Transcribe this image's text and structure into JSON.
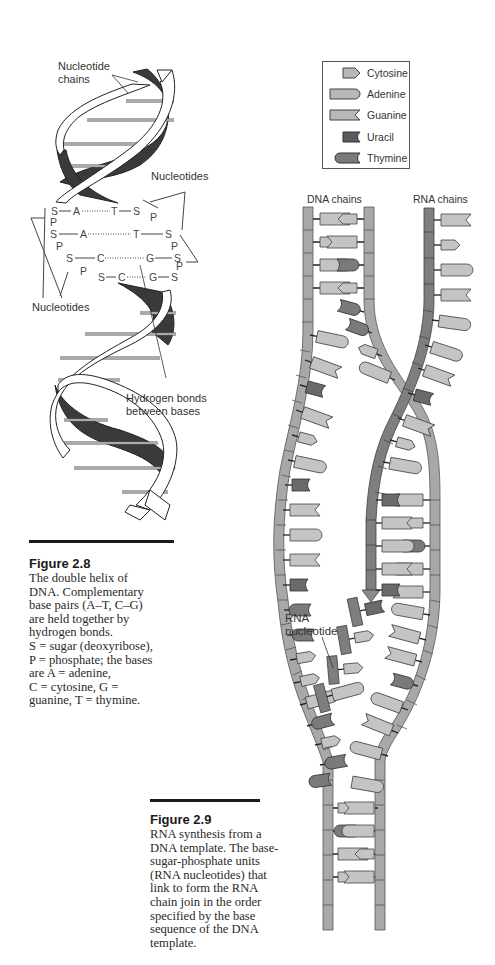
{
  "figure_2_8": {
    "labels": {
      "nucleotide_chains": "Nucleotide\nchains",
      "nucleotides_top": "Nucleotides",
      "nucleotides_left": "Nucleotides",
      "hydrogen_bonds": "Hydrogen bonds\nbetween bases"
    },
    "base_pair_rows": [
      {
        "left": [
          "S",
          "A"
        ],
        "right": [
          "T",
          "S"
        ],
        "bond": "A······T"
      },
      {
        "left": [
          "S",
          "A"
        ],
        "right": [
          "T",
          "S"
        ],
        "bond": "A··········T"
      },
      {
        "left": [
          "S",
          "C"
        ],
        "right": [
          "G",
          "S"
        ],
        "bond": "C··········G"
      },
      {
        "left": [
          "S",
          "C"
        ],
        "right": [
          "G",
          "S"
        ],
        "bond": "C······G"
      }
    ],
    "caption": {
      "title": "Figure 2.8",
      "text": "The double helix of\nDNA. Complementary\nbase pairs (A–T, C–G)\nare held together by\nhydrogen bonds.\nS = sugar (deoxyribose),\nP = phosphate; the bases\nare A = adenine,\nC = cytosine, G =\nguanine, T = thymine."
    }
  },
  "figure_2_9": {
    "legend": {
      "items": [
        {
          "name": "Cytosine",
          "shape": "cytosine-icon",
          "color": "#b8b8b8"
        },
        {
          "name": "Adenine",
          "shape": "adenine-icon",
          "color": "#b8b8b8"
        },
        {
          "name": "Guanine",
          "shape": "guanine-icon",
          "color": "#b8b8b8"
        },
        {
          "name": "Uracil",
          "shape": "uracil-icon",
          "color": "#5a5a5a"
        },
        {
          "name": "Thymine",
          "shape": "thymine-icon",
          "color": "#7a7a7a"
        }
      ]
    },
    "labels": {
      "dna_chains": "DNA chains",
      "rna_chains": "RNA chains",
      "rna_nucleotide": "RNA\nnucleotide"
    },
    "caption": {
      "title": "Figure 2.9",
      "text": "RNA synthesis from a\nDNA template. The base-\nsugar-phosphate units\n(RNA nucleotides) that\nlink to form the RNA\nchain join in the order\nspecified by the base\nsequence of the DNA\ntemplate."
    }
  },
  "colors": {
    "backbone_light": "#a8a8a8",
    "backbone_dark": "#7e7e7e",
    "base_light": "#c4c4c4",
    "base_dark": "#6a6a6a",
    "ribbon_dark": "#3a3a3a",
    "ink": "#1a1a1a"
  }
}
